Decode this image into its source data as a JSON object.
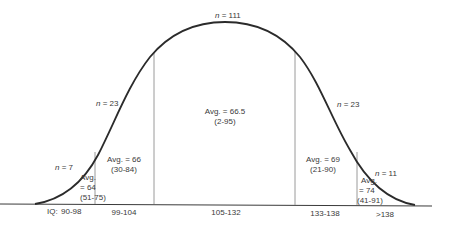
{
  "diagram": {
    "type": "bell-curve-distribution",
    "axis_prefix": "IQ:",
    "colors": {
      "curve": "#2b2b2b",
      "divider": "#9a9a9a",
      "baseline": "#3a3a3a",
      "text": "#3a3a3a"
    },
    "n_labels": [
      {
        "var": "n",
        "eq": "= 7"
      },
      {
        "var": "n",
        "eq": "= 23"
      },
      {
        "var": "n",
        "eq": "= 111"
      },
      {
        "var": "n",
        "eq": "= 23"
      },
      {
        "var": "n",
        "eq": "= 11"
      }
    ],
    "segments": [
      {
        "iq_range": "90-98",
        "avg_line1": "Avg.",
        "avg_line2": "= 64",
        "range": "(51-75)"
      },
      {
        "iq_range": "99-104",
        "avg_line1": "Avg. = 66",
        "range": "(30-84)"
      },
      {
        "iq_range": "105-132",
        "avg_line1": "Avg. = 66.5",
        "range": "(2-95)"
      },
      {
        "iq_range": "133-138",
        "avg_line1": "Avg. = 69",
        "range": "(21-90)"
      },
      {
        "iq_range": ">138",
        "avg_line1": "Avg.",
        "avg_line2": "= 74",
        "range": "(41-91)"
      }
    ]
  }
}
